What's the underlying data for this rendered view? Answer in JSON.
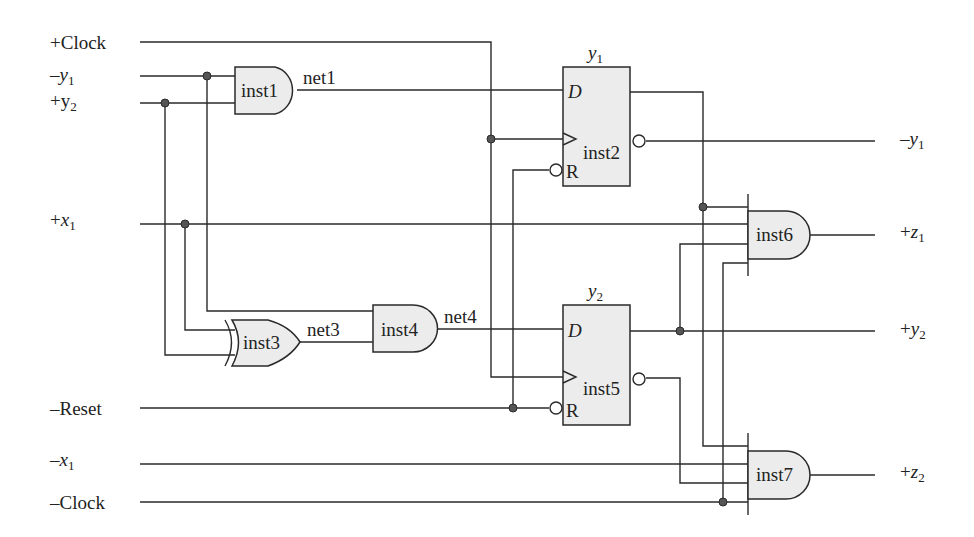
{
  "inputs": {
    "clock_pos": "+Clock",
    "y1_neg": {
      "prefix": "–",
      "var": "y",
      "sub": "1"
    },
    "y2_pos": {
      "prefix": "+",
      "var": "y",
      "sub": "2"
    },
    "x1_pos": {
      "prefix": "+",
      "var": "x",
      "sub": "1"
    },
    "reset_neg": "–Reset",
    "x1_neg": {
      "prefix": "–",
      "var": "x",
      "sub": "1"
    },
    "clock_neg": "–Clock"
  },
  "outputs": {
    "y1_neg": {
      "prefix": "–",
      "var": "y",
      "sub": "1"
    },
    "z1_pos": {
      "prefix": "+",
      "var": "z",
      "sub": "1"
    },
    "y2_pos": {
      "prefix": "+",
      "var": "y",
      "sub": "2"
    },
    "z2_pos": {
      "prefix": "+",
      "var": "z",
      "sub": "2"
    }
  },
  "gates": {
    "inst1": "inst1",
    "inst3": "inst3",
    "inst4": "inst4",
    "inst6": "inst6",
    "inst7": "inst7"
  },
  "flipflops": {
    "ff1": {
      "title_var": "y",
      "title_sub": "1",
      "inst": "inst2",
      "d_label": "D",
      "r_label": "R"
    },
    "ff2": {
      "title_var": "y",
      "title_sub": "2",
      "inst": "inst5",
      "d_label": "D",
      "r_label": "R"
    }
  },
  "nets": {
    "net1": "net1",
    "net3": "net3",
    "net4": "net4"
  }
}
